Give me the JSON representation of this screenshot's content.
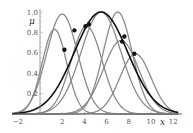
{
  "chart_data": {
    "type": "line",
    "title": "",
    "xlabel": "x",
    "ylabel": "μ",
    "xlim": [
      -2,
      12.5
    ],
    "ylim": [
      0,
      1.0
    ],
    "grid": false,
    "legend": null,
    "x_ticks": [
      "−2",
      "2",
      "4",
      "6",
      "8",
      "10",
      "12"
    ],
    "x_tick_values": [
      -2,
      2,
      4,
      6,
      8,
      10,
      12
    ],
    "y_ticks": [
      "0.2",
      "0.4",
      "0.6",
      "0.8",
      "1.0"
    ],
    "y_tick_values": [
      0.2,
      0.4,
      0.6,
      0.8,
      1.0
    ],
    "series": [
      {
        "name": "membership-1",
        "color": "#8a8a8a",
        "shape": "gaussian",
        "center": 1.3,
        "peak": 0.83,
        "sigma": 1.1
      },
      {
        "name": "membership-2",
        "color": "#8a8a8a",
        "shape": "gaussian",
        "center": 2.0,
        "peak": 0.98,
        "sigma": 1.4
      },
      {
        "name": "membership-3",
        "color": "#8a8a8a",
        "shape": "gaussian",
        "center": 4.2,
        "peak": 0.86,
        "sigma": 1.4
      },
      {
        "name": "membership-4",
        "color": "#8a8a8a",
        "shape": "gaussian",
        "center": 5.5,
        "peak": 1.0,
        "sigma": 1.8
      },
      {
        "name": "membership-5",
        "color": "#8a8a8a",
        "shape": "gaussian",
        "center": 7.0,
        "peak": 1.0,
        "sigma": 1.3
      },
      {
        "name": "membership-6",
        "color": "#8a8a8a",
        "shape": "gaussian",
        "center": 7.3,
        "peak": 0.72,
        "sigma": 1.6
      },
      {
        "name": "membership-7",
        "color": "#8a8a8a",
        "shape": "gaussian",
        "center": 8.6,
        "peak": 0.59,
        "sigma": 1.4
      },
      {
        "name": "aggregate",
        "color": "#111111",
        "shape": "gaussian",
        "center": 5.5,
        "peak": 1.0,
        "sigma": 2.4
      }
    ],
    "points": [
      {
        "x": 2.2,
        "y": 0.63
      },
      {
        "x": 3.1,
        "y": 0.82
      },
      {
        "x": 4.1,
        "y": 0.86
      },
      {
        "x": 4.4,
        "y": 0.88
      },
      {
        "x": 7.4,
        "y": 0.71
      },
      {
        "x": 7.6,
        "y": 0.76
      },
      {
        "x": 8.5,
        "y": 0.59
      }
    ]
  },
  "plot_area": {
    "x0_px": 40,
    "y0_px": 114,
    "px_per_x": 11.1,
    "px_per_y": 102
  }
}
